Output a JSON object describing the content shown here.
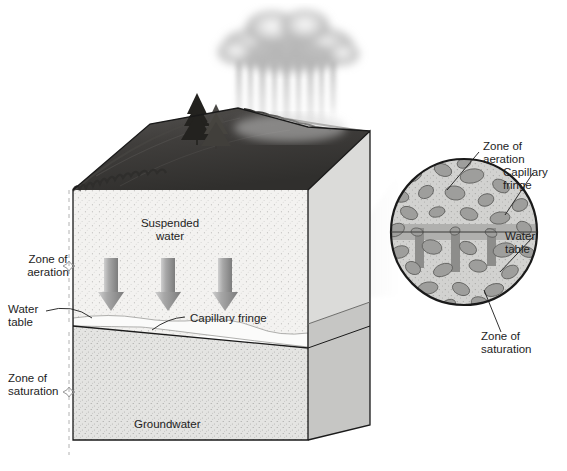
{
  "figure": {
    "type": "geology-cross-section-diagram"
  },
  "colors": {
    "aeration_fill": "#f2f1ef",
    "saturation_fill": "#e2e2e0",
    "right_face_upper": "#d9d9d7",
    "right_face_lower": "#c9c9c7",
    "top_surface_dark": "#3b3a38",
    "cloud_gray": "#b9b9b9",
    "rain_gray": "#d8d8d8",
    "arrow_gray": "#9a9a9a",
    "grain_gray": "#9e9e9e",
    "inset_matrix": "#cfcfcd",
    "capillary_band": "#b3b3b1",
    "outline": "#1a1a1a",
    "bracket_line": "#b0b0b0",
    "cone_gray": "#ededed"
  },
  "main_block": {
    "labels": {
      "zone_of_aeration": "Zone of\naeration",
      "water_table": "Water\ntable",
      "zone_of_saturation": "Zone of\nsaturation",
      "suspended_water": "Suspended\nwater",
      "capillary_fringe": "Capillary fringe",
      "groundwater": "Groundwater"
    },
    "infiltration_arrows": 3,
    "arrow_direction": "down",
    "trees": 2,
    "precipitation": "rain"
  },
  "inset_circle": {
    "labels": {
      "zone_of_aeration": "Zone of\naeration",
      "capillary_fringe": "Capillary\nfringe",
      "water_table": "Water\ntable",
      "zone_of_saturation": "Zone of\nsaturation"
    },
    "grain_count": 46,
    "capillary_columns": 3
  }
}
